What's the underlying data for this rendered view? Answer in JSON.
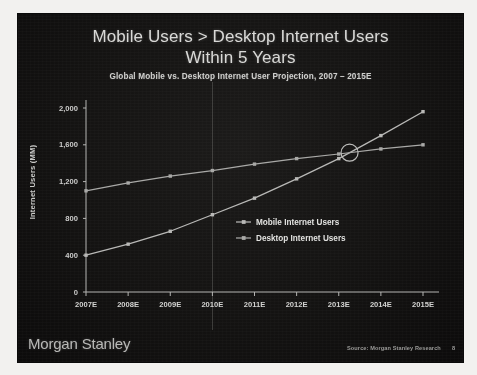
{
  "slide": {
    "title_line_1": "Mobile Users > Desktop Internet Users",
    "title_line_2": "Within 5 Years",
    "subtitle": "Global Mobile vs. Desktop Internet User Projection, 2007 – 2015E",
    "footer_logo": "Morgan Stanley",
    "footer_source": "Source: Morgan Stanley Research",
    "footer_page": "8",
    "background_color": "#141312",
    "text_color": "#d9d9d7"
  },
  "chart_data": {
    "type": "line",
    "title": "Global Mobile vs. Desktop Internet User Projection, 2007 – 2015E",
    "xlabel": "",
    "ylabel": "Internet Users (MM)",
    "categories": [
      "2007E",
      "2008E",
      "2009E",
      "2010E",
      "2011E",
      "2012E",
      "2013E",
      "2014E",
      "2015E"
    ],
    "ylim": [
      0,
      2000
    ],
    "yticks": [
      "0",
      "400",
      "800",
      "1,200",
      "1,600",
      "2,000"
    ],
    "ytick_values": [
      0,
      400,
      800,
      1200,
      1600,
      2000
    ],
    "grid": "vertical gridline at 2010E only",
    "legend_position": "inside center-right",
    "series": [
      {
        "name": "Mobile Internet Users",
        "color": "#b9b9b7",
        "values": [
          400,
          520,
          660,
          840,
          1020,
          1230,
          1450,
          1700,
          1960
        ]
      },
      {
        "name": "Desktop Internet Users",
        "color": "#a9a9a7",
        "values": [
          1100,
          1185,
          1260,
          1320,
          1390,
          1450,
          1500,
          1555,
          1600
        ]
      }
    ],
    "annotations": [
      {
        "label": "crossover-circle",
        "description": "Open circle marking the point where Mobile Internet Users overtakes Desktop Internet Users, between 2013E and 2014E at roughly 1,550 MM"
      }
    ]
  }
}
